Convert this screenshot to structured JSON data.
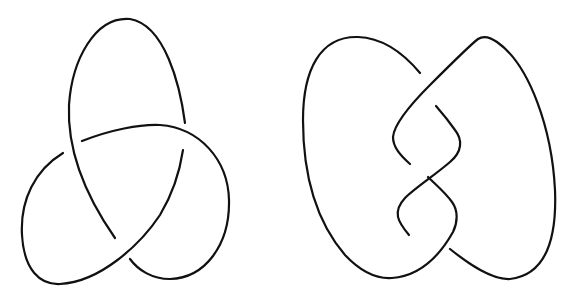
{
  "figure": {
    "stroke_color": "#111111",
    "background_color": "#ffffff",
    "stroke_width": 2.2,
    "knots": [
      {
        "name": "Trefoil knot",
        "crossings": 3,
        "position": "left"
      },
      {
        "name": "Figure-eight knot",
        "crossings": 4,
        "position": "right"
      }
    ]
  }
}
